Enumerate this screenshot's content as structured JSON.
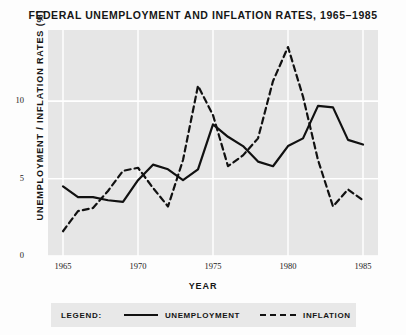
{
  "chart_data": {
    "type": "line",
    "title": "FEDERAL UNEMPLOYMENT AND INFLATION RATES, 1965–1985",
    "xlabel": "YEAR",
    "ylabel": "UNEMPLOYMENT / INFLATION RATES (%)",
    "x": [
      1965,
      1966,
      1967,
      1968,
      1969,
      1970,
      1971,
      1972,
      1973,
      1974,
      1975,
      1976,
      1977,
      1978,
      1979,
      1980,
      1981,
      1982,
      1983,
      1984,
      1985
    ],
    "xlim": [
      1964,
      1986
    ],
    "ylim": [
      0,
      14.6
    ],
    "xticks": [
      1965,
      1970,
      1975,
      1980,
      1985
    ],
    "xtick_labels": [
      "1965",
      "1970",
      "1975",
      "1980",
      "1985"
    ],
    "yticks": [
      0,
      5,
      10
    ],
    "ytick_labels": [
      "0",
      "5",
      "10"
    ],
    "grid": true,
    "legend_position": "below-axes",
    "series": [
      {
        "name": "UNEMPLOYMENT",
        "style": "solid",
        "color": "#111111",
        "values": [
          4.5,
          3.8,
          3.8,
          3.6,
          3.5,
          4.9,
          5.9,
          5.6,
          4.9,
          5.6,
          8.5,
          7.7,
          7.1,
          6.1,
          5.8,
          7.1,
          7.6,
          9.7,
          9.6,
          7.5,
          7.2
        ]
      },
      {
        "name": "INFLATION",
        "style": "dashed",
        "color": "#111111",
        "values": [
          1.6,
          2.9,
          3.1,
          4.2,
          5.5,
          5.7,
          4.4,
          3.2,
          6.2,
          11.0,
          9.1,
          5.8,
          6.5,
          7.6,
          11.3,
          13.5,
          10.3,
          6.2,
          3.2,
          4.3,
          3.6
        ]
      }
    ]
  },
  "legend": {
    "title": "LEGEND:",
    "entries": [
      {
        "label": "UNEMPLOYMENT",
        "style": "solid"
      },
      {
        "label": "INFLATION",
        "style": "dashed"
      }
    ]
  }
}
